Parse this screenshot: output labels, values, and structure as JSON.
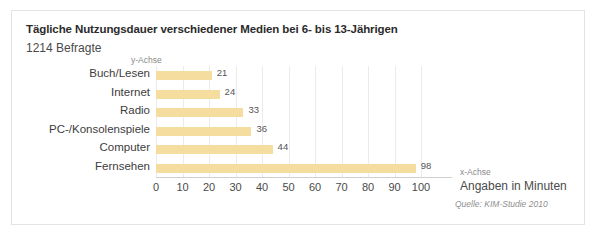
{
  "chart_data": {
    "type": "bar",
    "orientation": "horizontal",
    "title": "Tägliche Nutzungsdauer verschiedener Medien bei 6- bis 13-Jährigen",
    "subtitle": "1214 Befragte",
    "categories": [
      "Buch/Lesen",
      "Internet",
      "Radio",
      "PC-/Konsolenspiele",
      "Computer",
      "Fernsehen"
    ],
    "values": [
      21,
      24,
      33,
      36,
      44,
      98
    ],
    "value_labels": [
      "21",
      "24",
      "33",
      "36",
      "44",
      "98"
    ],
    "xlabel": "x-Achse",
    "ylabel": "y-Achse",
    "x_units": "Angaben in Minuten",
    "xlim": [
      0,
      100
    ],
    "xticks": [
      0,
      10,
      20,
      30,
      40,
      50,
      60,
      70,
      80,
      90,
      100
    ],
    "xtick_labels": [
      "0",
      "10",
      "20",
      "30",
      "40",
      "50",
      "60",
      "70",
      "80",
      "90",
      "100"
    ],
    "grid": true,
    "grid_axis": "x",
    "legend": false,
    "source": "Quelle: KIM-Studie 2010",
    "bar_color": "#f5dda0",
    "grid_color": "#ebebeb",
    "axis_color": "#cfcfcf",
    "text_color": "#3d3d3d"
  }
}
